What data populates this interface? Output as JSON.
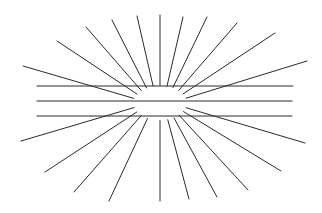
{
  "figure": {
    "title": "",
    "colors": {
      "background": "#ffffff",
      "stroke": "#2a2a2a"
    },
    "center": [
      160,
      103
    ],
    "hole": {
      "rx": 27,
      "ry": 14
    },
    "horizontal_lines": [
      {
        "x1": 37,
        "x2": 293,
        "y": 86
      },
      {
        "x1": 37,
        "x2": 292,
        "y": 101
      },
      {
        "x1": 37,
        "x2": 292,
        "y": 116
      }
    ],
    "rays_outer_points": [
      [
        23,
        66
      ],
      [
        57,
        41
      ],
      [
        86,
        27
      ],
      [
        112,
        20
      ],
      [
        137,
        16
      ],
      [
        160,
        15
      ],
      [
        183,
        17
      ],
      [
        207,
        17
      ],
      [
        237,
        23
      ],
      [
        275,
        33
      ],
      [
        307,
        61
      ],
      [
        305,
        143
      ],
      [
        281,
        171
      ],
      [
        248,
        190
      ],
      [
        217,
        197
      ],
      [
        189,
        199
      ],
      [
        160,
        201
      ],
      [
        109,
        201
      ],
      [
        74,
        192
      ],
      [
        45,
        172
      ],
      [
        21,
        141
      ]
    ]
  }
}
